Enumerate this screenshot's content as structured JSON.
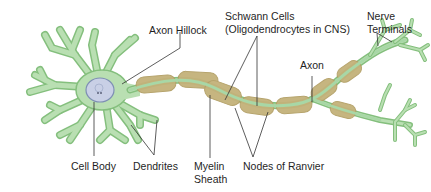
{
  "diagram": {
    "colors": {
      "cell_fill": "#b9dfb2",
      "cell_stroke": "#84bf7d",
      "axon_core": "#a8d7a6",
      "myelin_fill": "#c4b27a",
      "myelin_stroke": "#b3a066",
      "nucleus_fill": "#c9d0e6",
      "nucleus_stroke": "#7e8fb4",
      "leader_line": "#333333",
      "text": "#1f1f1f"
    },
    "labels": {
      "axon_hillock": "Axon Hillock",
      "schwann_line1": "Schwann Cells",
      "schwann_line2": "(Oligodendrocytes in CNS)",
      "nerve_terminals_line1": "Nerve",
      "nerve_terminals_line2": "Terminals",
      "axon": "Axon",
      "cell_body": "Cell Body",
      "dendrites": "Dendrites",
      "myelin_line1": "Myelin",
      "myelin_line2": "Sheath",
      "nodes_of_ranvier": "Nodes of Ranvier"
    }
  }
}
